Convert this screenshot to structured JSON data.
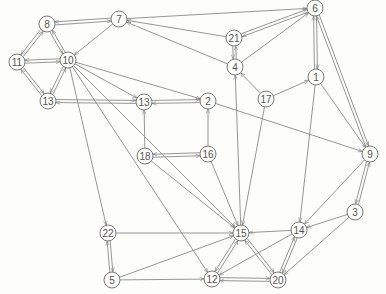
{
  "diagram": {
    "type": "directed-graph",
    "nodes": [
      {
        "id": "6",
        "x": 315,
        "y": 8
      },
      {
        "id": "7",
        "x": 119,
        "y": 19
      },
      {
        "id": "8",
        "x": 47,
        "y": 24
      },
      {
        "id": "21",
        "x": 234,
        "y": 38
      },
      {
        "id": "10",
        "x": 68,
        "y": 60
      },
      {
        "id": "11",
        "x": 17,
        "y": 62
      },
      {
        "id": "4",
        "x": 235,
        "y": 67
      },
      {
        "id": "1",
        "x": 316,
        "y": 77
      },
      {
        "id": "17",
        "x": 266,
        "y": 99
      },
      {
        "id": "13a",
        "label": "13",
        "x": 48,
        "y": 101
      },
      {
        "id": "13b",
        "label": "13",
        "x": 144,
        "y": 102
      },
      {
        "id": "2",
        "x": 208,
        "y": 101
      },
      {
        "id": "9",
        "x": 370,
        "y": 154
      },
      {
        "id": "18",
        "x": 145,
        "y": 156
      },
      {
        "id": "16",
        "x": 208,
        "y": 154
      },
      {
        "id": "3",
        "x": 355,
        "y": 212
      },
      {
        "id": "22",
        "x": 108,
        "y": 233
      },
      {
        "id": "15",
        "x": 241,
        "y": 233
      },
      {
        "id": "14",
        "x": 299,
        "y": 230
      },
      {
        "id": "5",
        "x": 112,
        "y": 280
      },
      {
        "id": "12",
        "x": 212,
        "y": 279
      },
      {
        "id": "20",
        "x": 278,
        "y": 280
      }
    ],
    "edges": [
      [
        "8",
        "7"
      ],
      [
        "7",
        "8"
      ],
      [
        "8",
        "11"
      ],
      [
        "11",
        "8"
      ],
      [
        "8",
        "10"
      ],
      [
        "10",
        "8"
      ],
      [
        "11",
        "10"
      ],
      [
        "10",
        "11"
      ],
      [
        "11",
        "13a"
      ],
      [
        "13a",
        "11"
      ],
      [
        "13a",
        "10"
      ],
      [
        "10",
        "13a"
      ],
      [
        "7",
        "10"
      ],
      [
        "7",
        "6"
      ],
      [
        "21",
        "6"
      ],
      [
        "6",
        "21"
      ],
      [
        "21",
        "7"
      ],
      [
        "4",
        "7"
      ],
      [
        "4",
        "21"
      ],
      [
        "21",
        "4"
      ],
      [
        "4",
        "6"
      ],
      [
        "17",
        "4"
      ],
      [
        "17",
        "1"
      ],
      [
        "1",
        "6"
      ],
      [
        "6",
        "1"
      ],
      [
        "6",
        "9"
      ],
      [
        "9",
        "6"
      ],
      [
        "1",
        "9"
      ],
      [
        "13a",
        "13b"
      ],
      [
        "13b",
        "13a"
      ],
      [
        "13b",
        "2"
      ],
      [
        "2",
        "13b"
      ],
      [
        "10",
        "13b"
      ],
      [
        "10",
        "2"
      ],
      [
        "18",
        "13b"
      ],
      [
        "16",
        "2"
      ],
      [
        "18",
        "16"
      ],
      [
        "16",
        "18"
      ],
      [
        "2",
        "9"
      ],
      [
        "10",
        "22"
      ],
      [
        "10",
        "15"
      ],
      [
        "10",
        "12"
      ],
      [
        "18",
        "15"
      ],
      [
        "16",
        "15"
      ],
      [
        "15",
        "4"
      ],
      [
        "17",
        "15"
      ],
      [
        "1",
        "14"
      ],
      [
        "9",
        "14"
      ],
      [
        "9",
        "3"
      ],
      [
        "3",
        "9"
      ],
      [
        "3",
        "14"
      ],
      [
        "3",
        "20"
      ],
      [
        "14",
        "15"
      ],
      [
        "14",
        "20"
      ],
      [
        "20",
        "14"
      ],
      [
        "14",
        "12"
      ],
      [
        "15",
        "20"
      ],
      [
        "20",
        "15"
      ],
      [
        "15",
        "12"
      ],
      [
        "12",
        "15"
      ],
      [
        "22",
        "15"
      ],
      [
        "22",
        "5"
      ],
      [
        "5",
        "22"
      ],
      [
        "5",
        "15"
      ],
      [
        "5",
        "12"
      ],
      [
        "12",
        "20"
      ],
      [
        "20",
        "12"
      ]
    ]
  }
}
